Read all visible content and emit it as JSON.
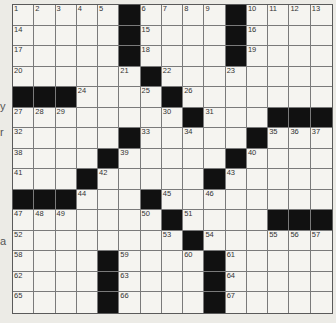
{
  "puzzle": {
    "rows": 15,
    "cols": 15,
    "colors": {
      "black": "#111111",
      "white": "#f5f4f0",
      "line": "#7a7a7a"
    },
    "black_cells": [
      [
        0,
        5
      ],
      [
        0,
        10
      ],
      [
        1,
        5
      ],
      [
        1,
        10
      ],
      [
        2,
        5
      ],
      [
        2,
        10
      ],
      [
        3,
        6
      ],
      [
        4,
        0
      ],
      [
        4,
        1
      ],
      [
        4,
        2
      ],
      [
        4,
        7
      ],
      [
        5,
        8
      ],
      [
        5,
        12
      ],
      [
        5,
        13
      ],
      [
        5,
        14
      ],
      [
        6,
        5
      ],
      [
        6,
        11
      ],
      [
        7,
        4
      ],
      [
        7,
        10
      ],
      [
        8,
        3
      ],
      [
        8,
        9
      ],
      [
        9,
        0
      ],
      [
        9,
        1
      ],
      [
        9,
        2
      ],
      [
        9,
        6
      ],
      [
        10,
        7
      ],
      [
        10,
        12
      ],
      [
        10,
        13
      ],
      [
        10,
        14
      ],
      [
        11,
        8
      ],
      [
        12,
        4
      ],
      [
        12,
        9
      ],
      [
        13,
        4
      ],
      [
        13,
        9
      ],
      [
        14,
        4
      ],
      [
        14,
        9
      ]
    ],
    "numbers": [
      {
        "n": "1",
        "r": 0,
        "c": 0
      },
      {
        "n": "2",
        "r": 0,
        "c": 1
      },
      {
        "n": "3",
        "r": 0,
        "c": 2
      },
      {
        "n": "4",
        "r": 0,
        "c": 3
      },
      {
        "n": "5",
        "r": 0,
        "c": 4
      },
      {
        "n": "6",
        "r": 0,
        "c": 6
      },
      {
        "n": "7",
        "r": 0,
        "c": 7
      },
      {
        "n": "8",
        "r": 0,
        "c": 8
      },
      {
        "n": "9",
        "r": 0,
        "c": 9
      },
      {
        "n": "10",
        "r": 0,
        "c": 11
      },
      {
        "n": "11",
        "r": 0,
        "c": 12
      },
      {
        "n": "12",
        "r": 0,
        "c": 13
      },
      {
        "n": "13",
        "r": 0,
        "c": 14
      },
      {
        "n": "14",
        "r": 1,
        "c": 0
      },
      {
        "n": "15",
        "r": 1,
        "c": 6
      },
      {
        "n": "16",
        "r": 1,
        "c": 11
      },
      {
        "n": "17",
        "r": 2,
        "c": 0
      },
      {
        "n": "18",
        "r": 2,
        "c": 6
      },
      {
        "n": "19",
        "r": 2,
        "c": 11
      },
      {
        "n": "20",
        "r": 3,
        "c": 0
      },
      {
        "n": "21",
        "r": 3,
        "c": 5
      },
      {
        "n": "22",
        "r": 3,
        "c": 7
      },
      {
        "n": "23",
        "r": 3,
        "c": 10
      },
      {
        "n": "24",
        "r": 4,
        "c": 3
      },
      {
        "n": "25",
        "r": 4,
        "c": 6
      },
      {
        "n": "26",
        "r": 4,
        "c": 8
      },
      {
        "n": "27",
        "r": 5,
        "c": 0
      },
      {
        "n": "28",
        "r": 5,
        "c": 1
      },
      {
        "n": "29",
        "r": 5,
        "c": 2
      },
      {
        "n": "30",
        "r": 5,
        "c": 7
      },
      {
        "n": "31",
        "r": 5,
        "c": 9
      },
      {
        "n": "32",
        "r": 6,
        "c": 0
      },
      {
        "n": "33",
        "r": 6,
        "c": 6
      },
      {
        "n": "34",
        "r": 6,
        "c": 8
      },
      {
        "n": "35",
        "r": 6,
        "c": 12
      },
      {
        "n": "36",
        "r": 6,
        "c": 13
      },
      {
        "n": "37",
        "r": 6,
        "c": 14
      },
      {
        "n": "38",
        "r": 7,
        "c": 0
      },
      {
        "n": "39",
        "r": 7,
        "c": 5
      },
      {
        "n": "40",
        "r": 7,
        "c": 11
      },
      {
        "n": "41",
        "r": 8,
        "c": 0
      },
      {
        "n": "42",
        "r": 8,
        "c": 4
      },
      {
        "n": "43",
        "r": 8,
        "c": 10
      },
      {
        "n": "44",
        "r": 9,
        "c": 3
      },
      {
        "n": "45",
        "r": 9,
        "c": 7
      },
      {
        "n": "46",
        "r": 9,
        "c": 9
      },
      {
        "n": "47",
        "r": 10,
        "c": 0
      },
      {
        "n": "48",
        "r": 10,
        "c": 1
      },
      {
        "n": "49",
        "r": 10,
        "c": 2
      },
      {
        "n": "50",
        "r": 10,
        "c": 6
      },
      {
        "n": "51",
        "r": 10,
        "c": 8
      },
      {
        "n": "52",
        "r": 11,
        "c": 0
      },
      {
        "n": "53",
        "r": 11,
        "c": 7
      },
      {
        "n": "54",
        "r": 11,
        "c": 9
      },
      {
        "n": "55",
        "r": 11,
        "c": 12
      },
      {
        "n": "56",
        "r": 11,
        "c": 13
      },
      {
        "n": "57",
        "r": 11,
        "c": 14
      },
      {
        "n": "58",
        "r": 12,
        "c": 0
      },
      {
        "n": "59",
        "r": 12,
        "c": 5
      },
      {
        "n": "60",
        "r": 12,
        "c": 8
      },
      {
        "n": "61",
        "r": 12,
        "c": 10
      },
      {
        "n": "62",
        "r": 13,
        "c": 0
      },
      {
        "n": "63",
        "r": 13,
        "c": 5
      },
      {
        "n": "64",
        "r": 13,
        "c": 10
      },
      {
        "n": "65",
        "r": 14,
        "c": 0
      },
      {
        "n": "66",
        "r": 14,
        "c": 5
      },
      {
        "n": "67",
        "r": 14,
        "c": 10
      }
    ]
  },
  "margin_fragments": [
    {
      "text": "y",
      "top": 101
    },
    {
      "text": "r",
      "top": 127
    },
    {
      "text": "a",
      "top": 236
    }
  ]
}
